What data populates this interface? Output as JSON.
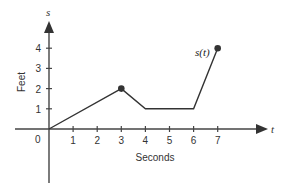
{
  "chart_data": {
    "type": "line",
    "title": "",
    "xlabel": "Seconds",
    "ylabel": "Feet",
    "x_axis_letter": "t",
    "y_axis_letter": "s",
    "origin_label": "0",
    "x_ticks": [
      "1",
      "2",
      "3",
      "4",
      "5",
      "6",
      "7"
    ],
    "y_ticks": [
      "1",
      "2",
      "3",
      "4"
    ],
    "xlim": [
      0,
      7
    ],
    "ylim": [
      0,
      4
    ],
    "grid": false,
    "series": [
      {
        "name": "s(t)",
        "x": [
          0,
          3,
          4,
          6,
          7
        ],
        "y": [
          0,
          2,
          1,
          1,
          4
        ],
        "marked_points": [
          [
            3,
            2
          ],
          [
            7,
            4
          ]
        ]
      }
    ],
    "annotations": [
      {
        "text": "s(t)",
        "x": 7,
        "y": 4
      }
    ]
  }
}
